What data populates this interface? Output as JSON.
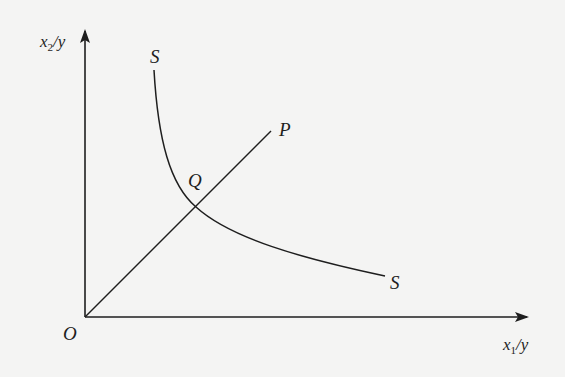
{
  "diagram": {
    "type": "isoquant-diagram",
    "axes": {
      "y_label": {
        "main": "x",
        "sub": "2",
        "rest": "/y"
      },
      "x_label": {
        "main": "x",
        "sub": "1",
        "rest": "/y"
      },
      "origin_label": "O"
    },
    "curve": {
      "name": "SS",
      "label_top": "S",
      "label_bottom": "S",
      "description": "Unit isoquant curve convex to origin"
    },
    "ray": {
      "label": "P",
      "description": "Ray from origin O through Q to P"
    },
    "intersection": {
      "label": "Q",
      "description": "Point where ray OP intersects isoquant SS"
    },
    "colors": {
      "background": "#f4f4f3",
      "ink": "#1e1e1e"
    }
  }
}
